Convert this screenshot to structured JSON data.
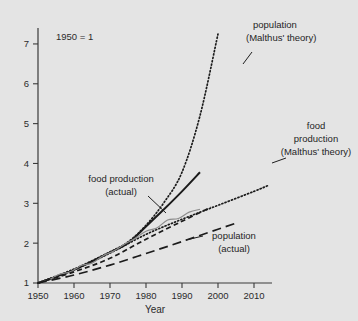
{
  "chart_data": {
    "type": "line",
    "title": "",
    "note": "1950 = 1",
    "xlabel": "Year",
    "ylabel": "",
    "xlim": [
      1950,
      2015
    ],
    "ylim": [
      1,
      7.4
    ],
    "grid": false,
    "legend_position": "inline-annotations",
    "xticks": [
      "1950",
      "1960",
      "1970",
      "1980",
      "1990",
      "2000",
      "2010"
    ],
    "xtick_values": [
      1950,
      1960,
      1970,
      1980,
      1990,
      2000,
      2010
    ],
    "yticks": [
      "1",
      "2",
      "3",
      "4",
      "5",
      "6",
      "7"
    ],
    "ytick_values": [
      1,
      2,
      3,
      4,
      5,
      6,
      7
    ],
    "series": [
      {
        "name": "population (Malthus' theory)",
        "style": "dotted",
        "color": "#1b1b1b",
        "x": [
          1950,
          1960,
          1970,
          1975,
          1980,
          1985,
          1990,
          1995,
          2000
        ],
        "values": [
          1.0,
          1.35,
          1.78,
          2.03,
          2.45,
          3.02,
          3.78,
          5.2,
          7.25
        ]
      },
      {
        "name": "food production (Malthus' theory)",
        "style": "dotted",
        "color": "#1b1b1b",
        "x": [
          1950,
          1960,
          1970,
          1980,
          1990,
          2000,
          2010,
          2014
        ],
        "values": [
          1.0,
          1.33,
          1.75,
          2.22,
          2.6,
          2.95,
          3.3,
          3.45
        ]
      },
      {
        "name": "food production (actual)",
        "style": "solid",
        "color": "#1b1b1b",
        "x": [
          1950,
          1960,
          1970,
          1975,
          1980,
          1985,
          1990,
          1995
        ],
        "values": [
          1.0,
          1.33,
          1.77,
          2.0,
          2.42,
          2.85,
          3.3,
          3.78
        ]
      },
      {
        "name": "food production (actual) measured",
        "style": "wiggle",
        "color": "#8c8c8c",
        "x": [
          1950,
          1953,
          1956,
          1959,
          1962,
          1965,
          1968,
          1971,
          1974,
          1977,
          1980,
          1983,
          1986,
          1989,
          1992,
          1995
        ],
        "values": [
          1.0,
          1.08,
          1.22,
          1.28,
          1.44,
          1.5,
          1.68,
          1.8,
          1.97,
          2.12,
          2.3,
          2.38,
          2.58,
          2.62,
          2.78,
          2.85
        ]
      },
      {
        "name": "population (actual)",
        "style": "longdash",
        "color": "#1b1b1b",
        "x": [
          1950,
          1960,
          1970,
          1980,
          1990,
          2000,
          2005
        ],
        "values": [
          1.0,
          1.2,
          1.45,
          1.74,
          2.04,
          2.35,
          2.5
        ]
      },
      {
        "name": "trend shortdash",
        "style": "shortdash",
        "color": "#1b1b1b",
        "x": [
          1950,
          1960,
          1970,
          1980,
          1990,
          1998
        ],
        "values": [
          1.0,
          1.28,
          1.62,
          2.1,
          2.55,
          2.9
        ]
      }
    ],
    "annotations": [
      {
        "id": "population-malthus",
        "text_lines": [
          "population",
          "(Malthus' theory)"
        ]
      },
      {
        "id": "food-production-malthus",
        "text_lines": [
          "food",
          "production",
          "(Malthus' theory)"
        ]
      },
      {
        "id": "food-production-actual",
        "text_lines": [
          "food production",
          "(actual)"
        ]
      },
      {
        "id": "population-actual",
        "text_lines": [
          "population",
          "(actual)"
        ]
      }
    ]
  }
}
